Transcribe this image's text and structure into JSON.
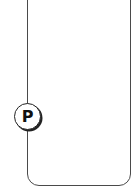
{
  "diagram": {
    "container": {
      "shape": "rounded-rectangle",
      "stroke_color": "#4a4a4a",
      "fill_color": "#ffffff"
    },
    "port": {
      "label": "P",
      "shape": "circle",
      "position": "left-edge",
      "stroke_color": "#222222"
    }
  }
}
